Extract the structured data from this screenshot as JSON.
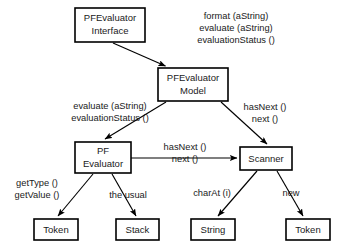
{
  "diagram": {
    "type": "uml-collaboration",
    "stroke_color": "#000000",
    "box_fill": "#ffffff",
    "text_color": "#1a1a1a",
    "background": "#ffffff",
    "boxes": [
      {
        "id": "pfevaluator-interface",
        "lines": [
          "PFEvaluator",
          "Interface"
        ],
        "x": 75,
        "y": 8,
        "w": 70,
        "h": 34
      },
      {
        "id": "pfevaluator-model",
        "lines": [
          "PFEvaluator",
          "Model"
        ],
        "x": 158,
        "y": 68,
        "w": 70,
        "h": 33
      },
      {
        "id": "pf-evaluator",
        "lines": [
          "PF",
          "Evaluator"
        ],
        "x": 75,
        "y": 142,
        "w": 56,
        "h": 31
      },
      {
        "id": "scanner",
        "lines": [
          "Scanner"
        ],
        "x": 240,
        "y": 147,
        "w": 52,
        "h": 23
      },
      {
        "id": "token-left",
        "lines": [
          "Token"
        ],
        "x": 34,
        "y": 219,
        "w": 44,
        "h": 21
      },
      {
        "id": "stack",
        "lines": [
          "Stack"
        ],
        "x": 116,
        "y": 219,
        "w": 43,
        "h": 21
      },
      {
        "id": "string",
        "lines": [
          "String"
        ],
        "x": 191,
        "y": 219,
        "w": 44,
        "h": 21
      },
      {
        "id": "token-right",
        "lines": [
          "Token"
        ],
        "x": 286,
        "y": 219,
        "w": 44,
        "h": 21
      }
    ],
    "edges": [
      {
        "id": "interface-to-model",
        "from": "pfevaluator-interface",
        "to": "pfevaluator-model"
      },
      {
        "id": "model-to-evaluator",
        "from": "pfevaluator-model",
        "to": "pf-evaluator"
      },
      {
        "id": "model-to-scanner",
        "from": "pfevaluator-model",
        "to": "scanner"
      },
      {
        "id": "evaluator-to-scanner",
        "from": "pf-evaluator",
        "to": "scanner"
      },
      {
        "id": "evaluator-to-token",
        "from": "pf-evaluator",
        "to": "token-left"
      },
      {
        "id": "evaluator-to-stack",
        "from": "pf-evaluator",
        "to": "stack"
      },
      {
        "id": "scanner-to-string",
        "from": "scanner",
        "to": "string"
      },
      {
        "id": "scanner-to-token",
        "from": "scanner",
        "to": "token-right"
      }
    ],
    "labels": [
      {
        "id": "interface-messages",
        "for_edge": "interface-to-model",
        "lines": [
          "format (aString)",
          "evaluate (aString)",
          "evaluationStatus ()"
        ],
        "x": 236,
        "y": 13,
        "align": "middle"
      },
      {
        "id": "model-to-evaluator-messages",
        "for_edge": "model-to-evaluator",
        "lines": [
          "evaluate (aString)",
          "evaluationStatus ()"
        ],
        "x": 110,
        "y": 103,
        "align": "middle"
      },
      {
        "id": "model-to-scanner-messages",
        "for_edge": "model-to-scanner",
        "lines": [
          "hasNext ()",
          "next ()"
        ],
        "x": 265,
        "y": 103,
        "align": "middle"
      },
      {
        "id": "evaluator-to-scanner-messages",
        "for_edge": "evaluator-to-scanner",
        "lines": [
          "hasNext ()",
          "next ()"
        ],
        "x": 185,
        "y": 147,
        "align": "middle"
      },
      {
        "id": "evaluator-to-token-messages",
        "for_edge": "evaluator-to-token",
        "lines": [
          "getType ()",
          "getValue ()"
        ],
        "x": 37,
        "y": 182,
        "align": "middle"
      },
      {
        "id": "evaluator-to-stack-messages",
        "for_edge": "evaluator-to-stack",
        "lines": [
          "the usual"
        ],
        "x": 128,
        "y": 196,
        "align": "middle"
      },
      {
        "id": "scanner-to-string-messages",
        "for_edge": "scanner-to-string",
        "lines": [
          "charAt (i)"
        ],
        "x": 212,
        "y": 193,
        "align": "middle"
      },
      {
        "id": "scanner-to-token-messages",
        "for_edge": "scanner-to-token",
        "lines": [
          "new"
        ],
        "x": 291,
        "y": 193,
        "align": "middle"
      }
    ]
  }
}
